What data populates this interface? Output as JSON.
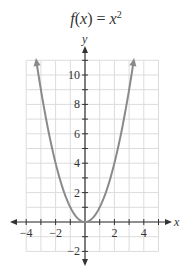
{
  "title": {
    "func": "f",
    "arg": "x",
    "equals": "=",
    "base": "x",
    "exp": "2"
  },
  "chart_data": {
    "type": "line",
    "xlabel": "x",
    "ylabel": "y",
    "xlim": [
      -4,
      5
    ],
    "ylim": [
      -2,
      11
    ],
    "x_ticks": [
      -4,
      -2,
      2,
      4
    ],
    "y_ticks": [
      -2,
      2,
      4,
      6,
      8,
      10
    ],
    "grid": true,
    "series": [
      {
        "name": "f(x) = x^2",
        "x": [
          -3.3,
          -3,
          -2,
          -1,
          0,
          1,
          2,
          3,
          3.3
        ],
        "y": [
          10.89,
          9,
          4,
          1,
          0,
          1,
          4,
          9,
          10.89
        ]
      }
    ],
    "colors": {
      "curve": "#8a8a8a",
      "grid": "#dcdcdc",
      "axis": "#333333"
    }
  },
  "labels": {
    "x_axis": "x",
    "y_axis": "y",
    "x_ticks": [
      "−4",
      "−2",
      "2",
      "4"
    ],
    "y_ticks": [
      "10",
      "8",
      "6",
      "4",
      "2",
      "−2"
    ]
  }
}
